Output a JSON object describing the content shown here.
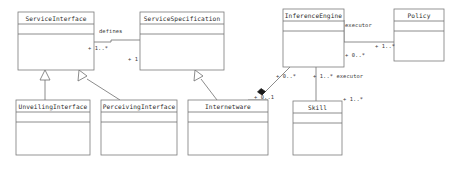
{
  "diagram": {
    "type": "uml-class-diagram",
    "background_color": "#ffffff",
    "line_color": "#6e6e6e",
    "text_color": "#2b2b2b",
    "classes": [
      {
        "id": "ServiceInterface",
        "name": "ServiceInterface",
        "x": 18,
        "y": 12,
        "w": 76,
        "h": 58
      },
      {
        "id": "ServiceSpecification",
        "name": "ServiceSpecification",
        "x": 140,
        "y": 12,
        "w": 84,
        "h": 58
      },
      {
        "id": "InferenceEngine",
        "name": "InferenceEngine",
        "x": 283,
        "y": 9,
        "w": 61,
        "h": 58
      },
      {
        "id": "Policy",
        "name": "Policy",
        "x": 394,
        "y": 9,
        "w": 50,
        "h": 52
      },
      {
        "id": "UnveilingInterface",
        "name": "UnveilingInterface",
        "x": 16,
        "y": 100,
        "w": 74,
        "h": 55
      },
      {
        "id": "PerceivingInterface",
        "name": "PerceivingInterface",
        "x": 101,
        "y": 100,
        "w": 76,
        "h": 55
      },
      {
        "id": "Internetware",
        "name": "Internetware",
        "x": 188,
        "y": 100,
        "w": 80,
        "h": 55
      },
      {
        "id": "Skill",
        "name": "Skill",
        "x": 293,
        "y": 101,
        "w": 49,
        "h": 54
      }
    ],
    "edge_labels": [
      {
        "id": "defines",
        "text": "defines",
        "x": 99,
        "y": 33
      },
      {
        "id": "si-mult",
        "text": "+ 1..*",
        "x": 88,
        "y": 50
      },
      {
        "id": "ss-mult",
        "text": "+ 1",
        "x": 128,
        "y": 61
      },
      {
        "id": "executor-top",
        "text": "executor",
        "x": 345,
        "y": 27
      },
      {
        "id": "policy-mult",
        "text": "+ 1..*",
        "x": 375,
        "y": 48
      },
      {
        "id": "ie-right-mult",
        "text": "+ 0..*",
        "x": 345,
        "y": 57
      },
      {
        "id": "ie-bottom-left-mult",
        "text": "+ 0..*",
        "x": 276,
        "y": 78
      },
      {
        "id": "executor-bottom",
        "text": "+ 1..* executor",
        "x": 313,
        "y": 78
      },
      {
        "id": "internetware-mult",
        "text": "+ 0..1",
        "x": 254,
        "y": 99
      },
      {
        "id": "skill-mult",
        "text": "+ 1..*",
        "x": 343,
        "y": 101
      }
    ],
    "generalizations": [
      {
        "id": "unveiling-to-serviceinterface",
        "from": "UnveilingInterface",
        "to": "ServiceInterface"
      },
      {
        "id": "perceiving-to-serviceinterface",
        "from": "PerceivingInterface",
        "to": "ServiceInterface"
      },
      {
        "id": "internetware-to-servicespec",
        "from": "Internetware",
        "to": "ServiceSpecification"
      }
    ],
    "associations": [
      {
        "id": "serviceinterface-defines-servicespecification",
        "from": "ServiceInterface",
        "to": "ServiceSpecification",
        "label": "defines"
      },
      {
        "id": "inferenceengine-executor-policy",
        "from": "InferenceEngine",
        "to": "Policy",
        "label": "executor"
      },
      {
        "id": "inferenceengine-executor-skill",
        "from": "InferenceEngine",
        "to": "Skill",
        "label": "executor"
      },
      {
        "id": "inferenceengine-aggregates-internetware",
        "from": "InferenceEngine",
        "to": "Internetware",
        "label": ""
      }
    ]
  }
}
